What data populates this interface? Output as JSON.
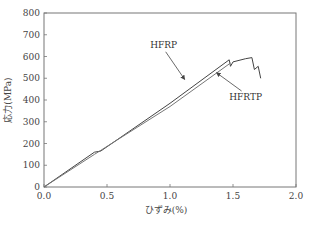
{
  "chart_data": {
    "type": "line",
    "title": "",
    "xlabel": "ひずみ(%)",
    "ylabel": "応力(MPa)",
    "xlim": [
      0,
      2.0
    ],
    "ylim": [
      0,
      800
    ],
    "xticks": [
      "0.0",
      "0.5",
      "1.0",
      "1.5",
      "2.0"
    ],
    "yticks": [
      "0",
      "100",
      "200",
      "300",
      "400",
      "500",
      "600",
      "700",
      "800"
    ],
    "grid": false,
    "legend": "annotations with arrows",
    "series": [
      {
        "name": "HFRP",
        "x": [
          0,
          0.4,
          0.45,
          1.0,
          1.47,
          1.48,
          1.5,
          1.6,
          1.65,
          1.67,
          1.7,
          1.72
        ],
        "y": [
          0,
          160,
          165,
          385,
          585,
          555,
          575,
          590,
          595,
          540,
          555,
          500
        ]
      },
      {
        "name": "HFRTP",
        "x": [
          0,
          0.4,
          1.0,
          1.48
        ],
        "y": [
          0,
          150,
          370,
          570
        ]
      }
    ],
    "annotations": [
      {
        "text": "HFRP",
        "x": 0.95,
        "y": 640
      },
      {
        "text": "HFRTP",
        "x": 1.6,
        "y": 400
      }
    ]
  }
}
